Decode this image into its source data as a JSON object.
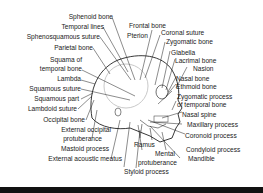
{
  "figure": {
    "colors": {
      "line": "#1a1a1a",
      "skull_outline": "#222222",
      "inner_circle": "#bbbbbb",
      "background": "#ffffff",
      "bottom_bar": "#111111"
    }
  },
  "labels_left": [
    {
      "text": "Sphenoid bone"
    },
    {
      "text": "Temporal lines"
    },
    {
      "text": "Sphenosquamous suture"
    },
    {
      "text": "Parietal bone"
    },
    {
      "text": "Squama of"
    },
    {
      "text": "temporal bone"
    },
    {
      "text": "Lambda"
    },
    {
      "text": "Squamous suture"
    },
    {
      "text": "Squamous part"
    },
    {
      "text": "Lambdoid suture"
    },
    {
      "text": "Occipital bone"
    },
    {
      "text": "External occipital"
    },
    {
      "text": "protuberance"
    },
    {
      "text": "Mastoid process"
    },
    {
      "text": "External acoustic meatus"
    }
  ],
  "labels_right": [
    {
      "text": "Frontal bone"
    },
    {
      "text": "Pterion"
    },
    {
      "text": "Coronal suture"
    },
    {
      "text": "Zygomatic bone"
    },
    {
      "text": "Glabella"
    },
    {
      "text": "Lacrimal bone"
    },
    {
      "text": "Nasion"
    },
    {
      "text": "Nasal bone"
    },
    {
      "text": "Ethmoid bone"
    },
    {
      "text": "Zygomatic process"
    },
    {
      "text": "of temporal bone"
    },
    {
      "text": "Nasal spine"
    },
    {
      "text": "Maxillary process"
    },
    {
      "text": "Coronoid process"
    },
    {
      "text": "Condyloid process"
    },
    {
      "text": "Mandible"
    }
  ],
  "labels_bottom": [
    {
      "text": "Ramus"
    },
    {
      "text": "Mental"
    },
    {
      "text": "protuberance"
    },
    {
      "text": "Styloid process"
    }
  ]
}
